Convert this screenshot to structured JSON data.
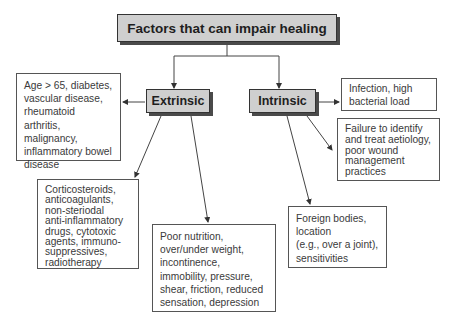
{
  "diagram": {
    "title": "Factors that can impair healing",
    "categories": [
      {
        "label": "Extrinsic",
        "factors": [
          "Age > 65, diabetes, vascular disease, rheumatoid arthritis, malignancy, inflammatory bowel disease",
          "Corticosteroids, anticoagulants, non-steriodal anti-inflammatory drugs, cytotoxic agents, immuno-suppressives, radiotherapy",
          "Poor nutrition, over/under weight, incontinence, immobility, pressure, shear, friction, reduced sensation, depression"
        ]
      },
      {
        "label": "Intrinsic",
        "factors": [
          "Infection, high bacterial load",
          "Failure to identify and treat aetiology, poor wound management practices",
          "Foreign bodies, location (e.g., over a joint), sensitivities"
        ]
      }
    ]
  },
  "boxes": {
    "age": [
      "Age > 65, diabetes,",
      "vascular disease,",
      "rheumatoid arthritis,",
      "malignancy,",
      "inflammatory bowel",
      "disease"
    ],
    "drugs": [
      "Corticosteroids,",
      "anticoagulants,",
      "non-steriodal",
      "anti-inflammatory",
      "drugs, cytotoxic",
      "agents, immuno-",
      "suppressives,",
      "radiotherapy"
    ],
    "nutrition": [
      "Poor nutrition,",
      "over/under weight,",
      "incontinence,",
      "immobility, pressure,",
      "shear, friction, reduced",
      "sensation, depression"
    ],
    "infection": [
      "Infection, high",
      "bacterial load"
    ],
    "failure": [
      "Failure to identify",
      "and treat aetiology,",
      "poor wound",
      "management",
      "practices"
    ],
    "foreign": [
      "Foreign bodies,",
      "location",
      "(e.g., over a joint),",
      "sensitivities"
    ]
  },
  "colors": {
    "node_fill": "#cfcfcf",
    "node_shadow": "#4a4a4a",
    "line": "#444444"
  }
}
